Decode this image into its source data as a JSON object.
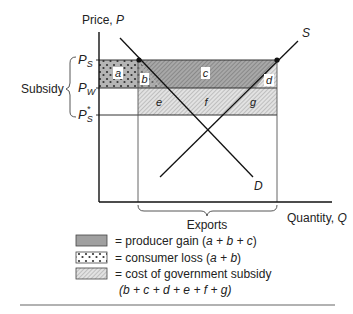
{
  "axes": {
    "y_label": "Price, ",
    "y_var": "P",
    "x_label": "Quantity, ",
    "x_var": "Q"
  },
  "price_labels": {
    "ps": {
      "base": "P",
      "sub": "S"
    },
    "pw": {
      "base": "P",
      "sub": "W"
    },
    "ps_star": {
      "base": "P",
      "sub": "S",
      "sup": "*"
    }
  },
  "brace_labels": {
    "subsidy": "Subsidy",
    "exports": "Exports"
  },
  "curves": {
    "supply": "S",
    "demand": "D"
  },
  "regions": {
    "a": "a",
    "b": "b",
    "c": "c",
    "d": "d",
    "e": "e",
    "f": "f",
    "g": "g"
  },
  "legend": [
    {
      "swatch": "solid-gray",
      "text": "= producer gain (",
      "formula": "a + b + c",
      "close": ")"
    },
    {
      "swatch": "dotted",
      "text": "= consumer loss (",
      "formula": "a + b",
      "close": ")"
    },
    {
      "swatch": "hatched",
      "text": "= cost of government subsidy",
      "line2": "(b + c + d + e + f + g)"
    }
  ],
  "colors": {
    "producer_gain": "#9a9a9a",
    "consumer_loss_bg": "#b8b8b8",
    "subsidy_hatch_bg": "#dcdcdc",
    "line": "#1a1a1a"
  }
}
